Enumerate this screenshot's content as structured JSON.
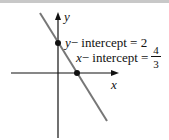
{
  "diagram": {
    "axes": {
      "x_label": "x",
      "y_label": "y"
    },
    "line": {
      "color": "#777777",
      "description": "line with negative slope"
    },
    "points": [
      {
        "name": "y-intercept",
        "label_var": "y",
        "label_text": "− intercept = 2"
      },
      {
        "name": "x-intercept",
        "label_var": "x",
        "label_text": "− intercept =",
        "frac_num": "4",
        "frac_den": "3"
      }
    ]
  }
}
